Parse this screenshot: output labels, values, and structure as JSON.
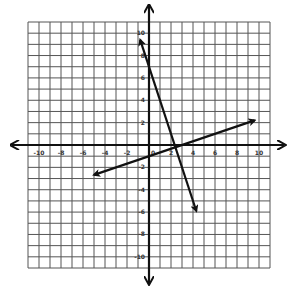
{
  "chart_data": {
    "type": "line",
    "title": "",
    "xlabel": "",
    "ylabel": "",
    "xlim": [
      -11,
      11
    ],
    "ylim": [
      -11,
      11
    ],
    "grid": true,
    "grid_step": 1,
    "x_tick_labels": [
      "-10",
      "-8",
      "-6",
      "-4",
      "-2",
      "0",
      "2",
      "4",
      "6",
      "8",
      "10"
    ],
    "y_tick_labels": [
      "10",
      "8",
      "6",
      "4",
      "2",
      "-2",
      "-4",
      "-6",
      "-8",
      "-10"
    ],
    "x_ticks": [
      -10,
      -8,
      -6,
      -4,
      -2,
      0,
      2,
      4,
      6,
      8,
      10
    ],
    "y_ticks": [
      10,
      8,
      6,
      4,
      2,
      -2,
      -4,
      -6,
      -8,
      -10
    ],
    "series": [
      {
        "name": "Line 1 (steep, negative slope)",
        "equation": "y = -3x + 7",
        "slope": -3,
        "intercept": 7,
        "x": [
          -0.8,
          4.3
        ],
        "y": [
          9.4,
          -5.9
        ],
        "arrows": "both"
      },
      {
        "name": "Line 2 (shallow, positive slope)",
        "equation": "y = (1/3)x - 1",
        "slope": 0.3333,
        "intercept": -1,
        "x": [
          -5,
          9.6
        ],
        "y": [
          -2.67,
          2.2
        ],
        "arrows": "both"
      }
    ],
    "intersection": {
      "x": 2.4,
      "y": -0.2
    },
    "legend": null
  },
  "colors": {
    "grid": "#555555",
    "axis": "#111111",
    "line": "#111111",
    "background": "#ffffff"
  }
}
